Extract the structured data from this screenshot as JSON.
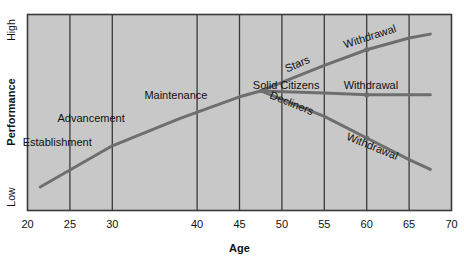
{
  "chart_data": {
    "type": "line",
    "title": "",
    "xlabel": "Age",
    "ylabel": "Performance",
    "xticks": [
      20,
      25,
      30,
      40,
      45,
      50,
      55,
      60,
      65,
      70
    ],
    "xtick_labels": [
      "20",
      "25",
      "30",
      "40",
      "45",
      "50",
      "55",
      "60",
      "65",
      "70"
    ],
    "xlim": [
      20,
      70
    ],
    "ylim": [
      0,
      100
    ],
    "ytick_labels": [
      "Low",
      "High"
    ],
    "y_low_label": "Low",
    "y_high_label": "High",
    "grid": "vertical",
    "legend": "none",
    "plot_facecolor": "#c8c8c8",
    "line_color": "#6e6e6e",
    "border_color": "#3a3a3a",
    "series": [
      {
        "name": "Career Growth",
        "points": [
          [
            21.5,
            12
          ],
          [
            30,
            33
          ],
          [
            38,
            47
          ],
          [
            45,
            58
          ],
          [
            47.5,
            61
          ]
        ]
      },
      {
        "name": "Stars",
        "points": [
          [
            47.5,
            61
          ],
          [
            55,
            74
          ],
          [
            60,
            82
          ],
          [
            65,
            88
          ],
          [
            67.5,
            90
          ]
        ]
      },
      {
        "name": "Solid Citizens",
        "points": [
          [
            47.5,
            61
          ],
          [
            55,
            60
          ],
          [
            60,
            59
          ],
          [
            67.5,
            59
          ]
        ]
      },
      {
        "name": "Decliners",
        "points": [
          [
            47.5,
            61
          ],
          [
            55,
            48
          ],
          [
            60,
            37
          ],
          [
            65,
            26
          ],
          [
            67.5,
            21
          ]
        ]
      }
    ],
    "annotations": [
      {
        "id": "establishment",
        "text": "Establishment",
        "x": 23.5,
        "y": 33,
        "rotation": 0
      },
      {
        "id": "advancement",
        "text": "Advancement",
        "x": 27.5,
        "y": 45,
        "rotation": 0
      },
      {
        "id": "maintenance",
        "text": "Maintenance",
        "x": 37.5,
        "y": 57,
        "rotation": 0
      },
      {
        "id": "stars",
        "text": "Stars",
        "x": 52.0,
        "y": 73,
        "rotation": -23
      },
      {
        "id": "solid-citizens",
        "text": "Solid Citizens",
        "x": 50.5,
        "y": 62,
        "rotation": 0
      },
      {
        "id": "decliners",
        "text": "Decliners",
        "x": 51.0,
        "y": 53,
        "rotation": 22
      },
      {
        "id": "withdrawal-stars",
        "text": "Withdrawal",
        "x": 60.5,
        "y": 87,
        "rotation": -18
      },
      {
        "id": "withdrawal-solid",
        "text": "Withdrawal",
        "x": 60.5,
        "y": 62,
        "rotation": 0
      },
      {
        "id": "withdrawal-decliners",
        "text": "Withdrawal",
        "x": 60.5,
        "y": 31,
        "rotation": 22
      }
    ],
    "markers": [
      {
        "series": "Stars",
        "x": 60,
        "y": 82
      },
      {
        "series": "Solid Citizens",
        "x": 60,
        "y": 59
      },
      {
        "series": "Decliners",
        "x": 60,
        "y": 37
      }
    ]
  },
  "axes": {
    "x_title": "Age",
    "y_title": "Performance",
    "y_top": "High",
    "y_bottom": "Low"
  }
}
